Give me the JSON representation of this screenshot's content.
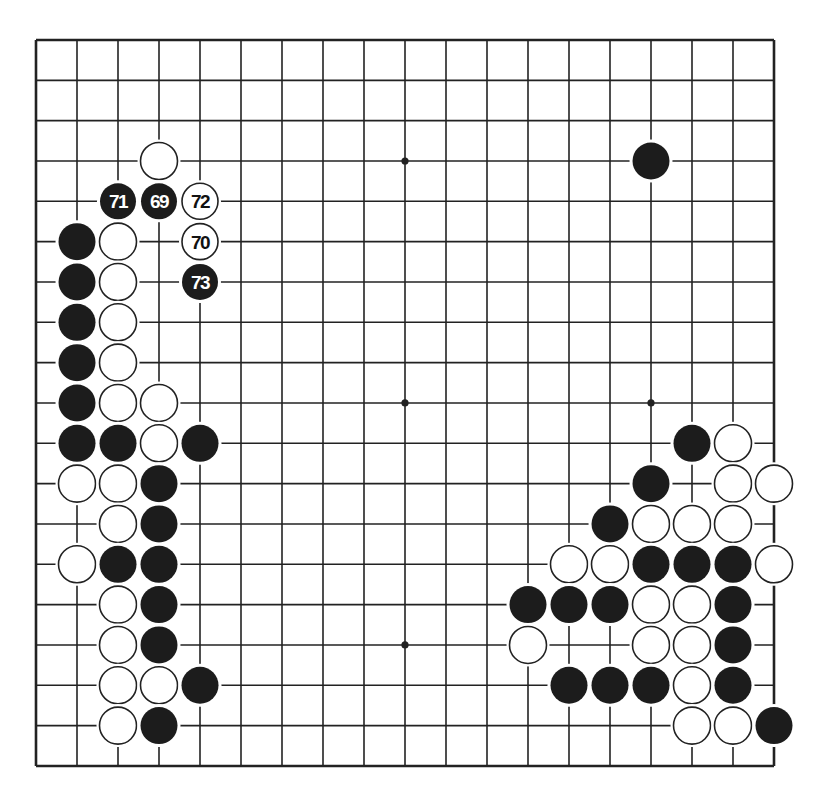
{
  "board": {
    "size": 19,
    "origin_x": 36,
    "origin_y": 40,
    "spacing_x": 41,
    "spacing_y": 40.33,
    "stone_radius": 18.5,
    "line_color": "#222222",
    "black_color": "#1c1c1c",
    "white_color": "#ffffff",
    "star_points": [
      [
        3,
        3
      ],
      [
        9,
        3
      ],
      [
        15,
        3
      ],
      [
        3,
        9
      ],
      [
        9,
        9
      ],
      [
        15,
        9
      ],
      [
        3,
        15
      ],
      [
        9,
        15
      ],
      [
        15,
        15
      ]
    ]
  },
  "stones": [
    {
      "col": 3,
      "row": 3,
      "color": "white"
    },
    {
      "col": 2,
      "row": 4,
      "color": "black",
      "label": "71"
    },
    {
      "col": 3,
      "row": 4,
      "color": "black",
      "label": "69"
    },
    {
      "col": 4,
      "row": 4,
      "color": "white",
      "label": "72"
    },
    {
      "col": 1,
      "row": 5,
      "color": "black"
    },
    {
      "col": 2,
      "row": 5,
      "color": "white"
    },
    {
      "col": 4,
      "row": 5,
      "color": "white",
      "label": "70"
    },
    {
      "col": 1,
      "row": 6,
      "color": "black"
    },
    {
      "col": 2,
      "row": 6,
      "color": "white"
    },
    {
      "col": 4,
      "row": 6,
      "color": "black",
      "label": "73"
    },
    {
      "col": 1,
      "row": 7,
      "color": "black"
    },
    {
      "col": 2,
      "row": 7,
      "color": "white"
    },
    {
      "col": 1,
      "row": 8,
      "color": "black"
    },
    {
      "col": 2,
      "row": 8,
      "color": "white"
    },
    {
      "col": 1,
      "row": 9,
      "color": "black"
    },
    {
      "col": 2,
      "row": 9,
      "color": "white"
    },
    {
      "col": 3,
      "row": 9,
      "color": "white"
    },
    {
      "col": 1,
      "row": 10,
      "color": "black"
    },
    {
      "col": 2,
      "row": 10,
      "color": "black"
    },
    {
      "col": 3,
      "row": 10,
      "color": "white"
    },
    {
      "col": 4,
      "row": 10,
      "color": "black"
    },
    {
      "col": 1,
      "row": 11,
      "color": "white"
    },
    {
      "col": 2,
      "row": 11,
      "color": "white"
    },
    {
      "col": 3,
      "row": 11,
      "color": "black"
    },
    {
      "col": 2,
      "row": 12,
      "color": "white"
    },
    {
      "col": 3,
      "row": 12,
      "color": "black"
    },
    {
      "col": 1,
      "row": 13,
      "color": "white"
    },
    {
      "col": 2,
      "row": 13,
      "color": "black"
    },
    {
      "col": 3,
      "row": 13,
      "color": "black"
    },
    {
      "col": 2,
      "row": 14,
      "color": "white"
    },
    {
      "col": 3,
      "row": 14,
      "color": "black"
    },
    {
      "col": 2,
      "row": 15,
      "color": "white"
    },
    {
      "col": 3,
      "row": 15,
      "color": "black"
    },
    {
      "col": 2,
      "row": 16,
      "color": "white"
    },
    {
      "col": 3,
      "row": 16,
      "color": "white"
    },
    {
      "col": 4,
      "row": 16,
      "color": "black"
    },
    {
      "col": 2,
      "row": 17,
      "color": "white"
    },
    {
      "col": 3,
      "row": 17,
      "color": "black"
    },
    {
      "col": 15,
      "row": 3,
      "color": "black"
    },
    {
      "col": 16,
      "row": 10,
      "color": "black"
    },
    {
      "col": 17,
      "row": 10,
      "color": "white"
    },
    {
      "col": 15,
      "row": 11,
      "color": "black"
    },
    {
      "col": 17,
      "row": 11,
      "color": "white"
    },
    {
      "col": 18,
      "row": 11,
      "color": "white"
    },
    {
      "col": 14,
      "row": 12,
      "color": "black"
    },
    {
      "col": 15,
      "row": 12,
      "color": "white"
    },
    {
      "col": 16,
      "row": 12,
      "color": "white"
    },
    {
      "col": 17,
      "row": 12,
      "color": "white"
    },
    {
      "col": 13,
      "row": 13,
      "color": "white"
    },
    {
      "col": 14,
      "row": 13,
      "color": "white"
    },
    {
      "col": 15,
      "row": 13,
      "color": "black"
    },
    {
      "col": 16,
      "row": 13,
      "color": "black"
    },
    {
      "col": 17,
      "row": 13,
      "color": "black"
    },
    {
      "col": 18,
      "row": 13,
      "color": "white"
    },
    {
      "col": 12,
      "row": 14,
      "color": "black"
    },
    {
      "col": 13,
      "row": 14,
      "color": "black"
    },
    {
      "col": 14,
      "row": 14,
      "color": "black"
    },
    {
      "col": 15,
      "row": 14,
      "color": "white"
    },
    {
      "col": 16,
      "row": 14,
      "color": "white"
    },
    {
      "col": 17,
      "row": 14,
      "color": "black"
    },
    {
      "col": 12,
      "row": 15,
      "color": "white"
    },
    {
      "col": 15,
      "row": 15,
      "color": "white"
    },
    {
      "col": 16,
      "row": 15,
      "color": "white"
    },
    {
      "col": 17,
      "row": 15,
      "color": "black"
    },
    {
      "col": 13,
      "row": 16,
      "color": "black"
    },
    {
      "col": 14,
      "row": 16,
      "color": "black"
    },
    {
      "col": 15,
      "row": 16,
      "color": "black"
    },
    {
      "col": 16,
      "row": 16,
      "color": "white"
    },
    {
      "col": 17,
      "row": 16,
      "color": "black"
    },
    {
      "col": 16,
      "row": 17,
      "color": "white"
    },
    {
      "col": 17,
      "row": 17,
      "color": "white"
    },
    {
      "col": 18,
      "row": 17,
      "color": "black"
    }
  ]
}
